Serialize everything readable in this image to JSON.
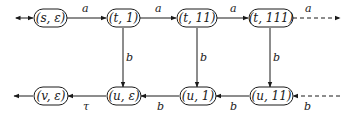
{
  "diagram": {
    "type": "state-transition-graph",
    "nodes": [
      {
        "id": "s_eps",
        "label": "(s, ε)"
      },
      {
        "id": "t_1",
        "label": "(t, 1)"
      },
      {
        "id": "t_11",
        "label": "(t, 11)"
      },
      {
        "id": "t_111",
        "label": "(t, 111)"
      },
      {
        "id": "v_eps",
        "label": "(v, ε)"
      },
      {
        "id": "u_eps",
        "label": "(u, ε)"
      },
      {
        "id": "u_1",
        "label": "(u, 1)"
      },
      {
        "id": "u_11",
        "label": "(u, 11)"
      }
    ],
    "edges": [
      {
        "from": "start",
        "to": "s_eps",
        "label": "",
        "style": "solid",
        "bidirectional": true
      },
      {
        "from": "s_eps",
        "to": "t_1",
        "label": "a",
        "style": "solid"
      },
      {
        "from": "t_1",
        "to": "t_11",
        "label": "a",
        "style": "solid"
      },
      {
        "from": "t_11",
        "to": "t_111",
        "label": "a",
        "style": "solid"
      },
      {
        "from": "t_111",
        "to": "continuation",
        "label": "a",
        "style": "dashed"
      },
      {
        "from": "t_1",
        "to": "u_eps",
        "label": "b",
        "style": "solid"
      },
      {
        "from": "t_11",
        "to": "u_1",
        "label": "b",
        "style": "solid"
      },
      {
        "from": "t_111",
        "to": "u_11",
        "label": "b",
        "style": "solid"
      },
      {
        "from": "continuation",
        "to": "u_11",
        "label": "b",
        "style": "dashed"
      },
      {
        "from": "u_11",
        "to": "u_1",
        "label": "b",
        "style": "solid"
      },
      {
        "from": "u_1",
        "to": "u_eps",
        "label": "b",
        "style": "solid"
      },
      {
        "from": "u_eps",
        "to": "v_eps",
        "label": "τ",
        "style": "solid"
      },
      {
        "from": "v_eps",
        "to": "exit",
        "label": "",
        "style": "solid"
      }
    ],
    "labels": {
      "a": "a",
      "b": "b",
      "tau": "τ"
    }
  }
}
